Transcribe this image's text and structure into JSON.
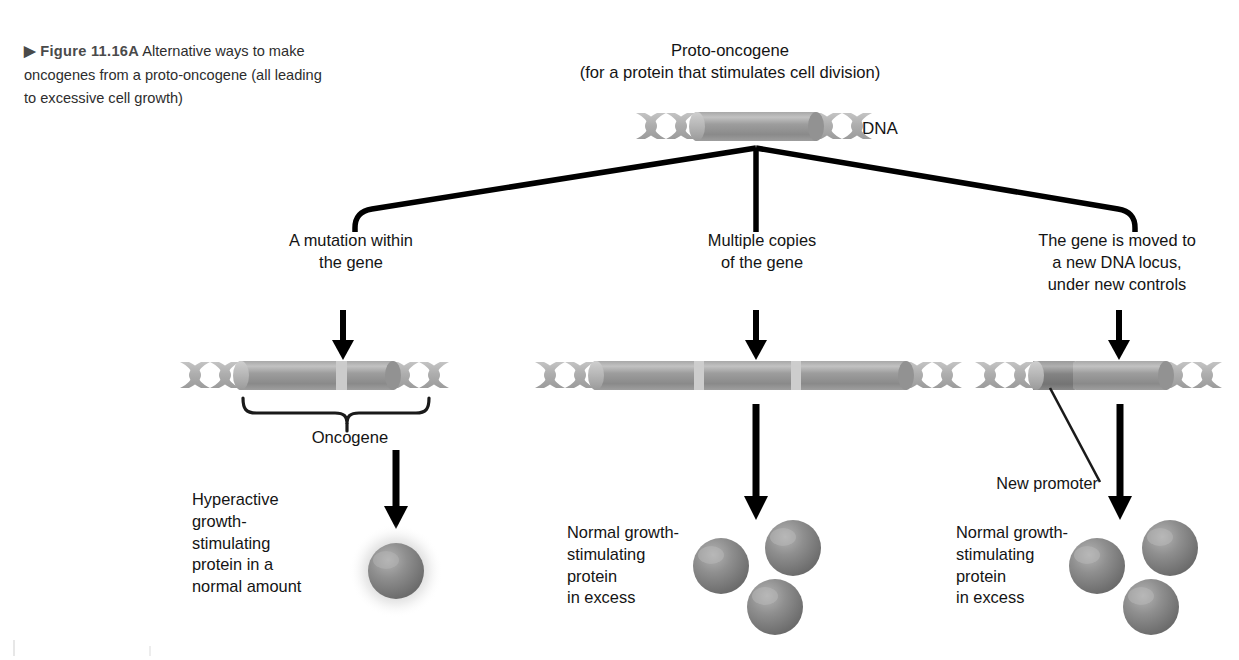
{
  "caption": {
    "marker": "▶",
    "figure_label": "Figure 11.16A",
    "text": "Alternative ways to make oncogenes from a proto-oncogene (all leading to excessive cell growth)"
  },
  "diagram": {
    "title": "Proto-oncogene\n(for a protein that stimulates cell division)",
    "dna_label": "DNA",
    "branches": [
      {
        "id": "mutation",
        "label": "A mutation within\nthe gene",
        "bracket_label": "Oncogene",
        "outcome_text": "Hyperactive\ngrowth-\nstimulating\nprotein in a\nnormal amount",
        "protein_count": 1,
        "protein_glow": true
      },
      {
        "id": "multiple-copies",
        "label": "Multiple copies\nof the gene",
        "outcome_text": "Normal growth-\nstimulating\nprotein\nin excess",
        "protein_count": 3,
        "protein_glow": false
      },
      {
        "id": "relocation",
        "label": "The gene is moved to\na new DNA locus,\nunder new controls",
        "annotation_label": "New promoter",
        "outcome_text": "Normal growth-\nstimulating\nprotein\nin excess",
        "protein_count": 3,
        "protein_glow": false
      }
    ]
  },
  "colors": {
    "background": "#ffffff",
    "text": "#141414",
    "caption_text": "#2d2d2d",
    "caption_label": "#4a4a4a",
    "arrow": "#000000",
    "dna_helix_light": "#b9b9b9",
    "dna_helix_mid": "#a6a6a6",
    "gene_body_dark": "#8c8c8c",
    "gene_body_mid": "#9b9b9b",
    "gene_body_light": "#c9c9c9",
    "gene_divider": "#cdcdcd",
    "promoter_dark": "#7e7e7e",
    "protein_dark": "#6f6f6f",
    "protein_mid": "#8d8d8d",
    "protein_light": "#b2b2b2",
    "glow": "#d9d9d9"
  }
}
